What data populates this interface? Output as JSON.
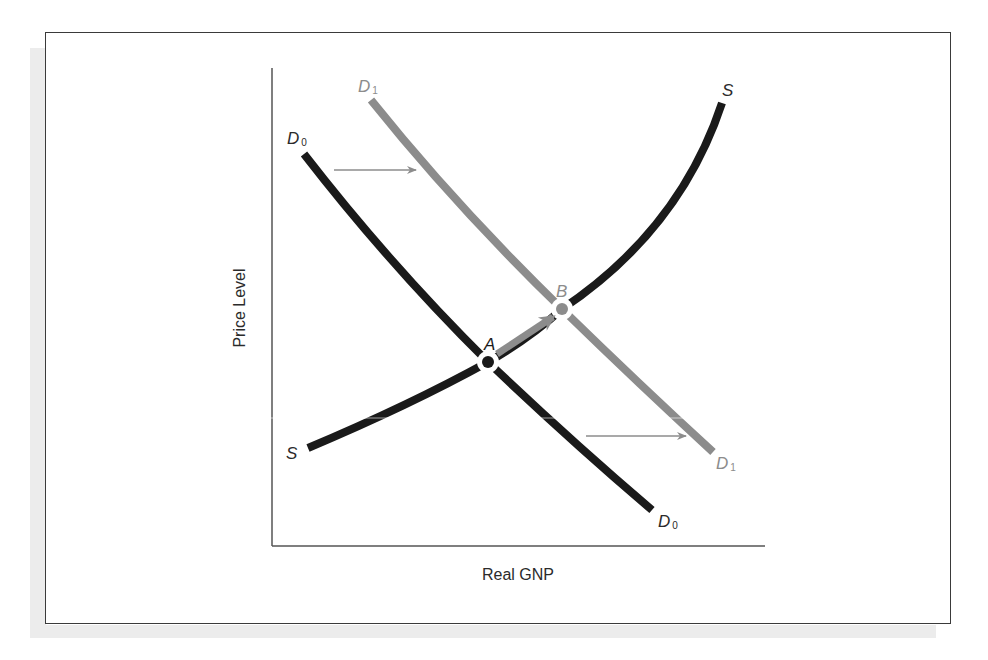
{
  "figure": {
    "axes": {
      "x_label": "Real GNP",
      "y_label": "Price Level"
    },
    "curves": {
      "s": {
        "label": "S",
        "color": "#1a1a1a"
      },
      "d0": {
        "label": "D",
        "subscript": "0",
        "color": "#1a1a1a"
      },
      "d1": {
        "label": "D",
        "subscript": "1",
        "color": "#8c8c8c"
      }
    },
    "points": {
      "a": {
        "label": "A",
        "color": "#1a1a1a"
      },
      "b": {
        "label": "B",
        "color": "#8c8c8c"
      }
    },
    "arrows": [
      {
        "name": "demand-shift-upper",
        "color": "#8c8c8c"
      },
      {
        "name": "demand-shift-lower",
        "color": "#8c8c8c"
      },
      {
        "name": "equilibrium-move",
        "color": "#8c8c8c"
      }
    ]
  }
}
